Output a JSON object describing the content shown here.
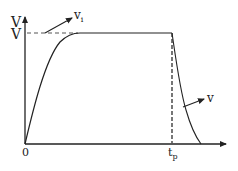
{
  "diagram": {
    "type": "voltage pulse waveform",
    "y_axis_label": "V",
    "level_label": "V",
    "origin_label": "0",
    "time_label_main": "t",
    "time_label_sub": "p",
    "input_label_main": "v",
    "input_label_sub": "i",
    "output_label": "v",
    "colors": {
      "line": "#222222",
      "dashed": "#555555",
      "background": "#ffffff"
    }
  }
}
